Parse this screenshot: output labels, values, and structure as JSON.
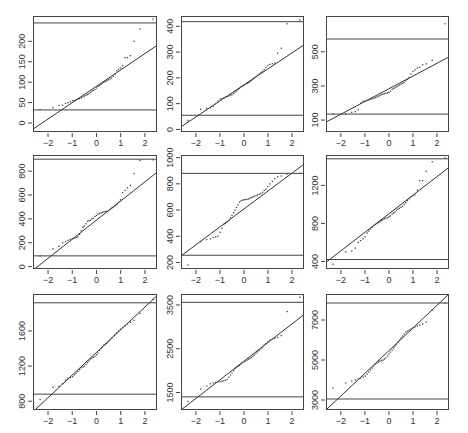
{
  "figure": {
    "title": "",
    "width": 468,
    "height": 433,
    "colors": {
      "frame": "#444444",
      "line": "#333333",
      "points": "#444444",
      "text": "#333333",
      "background": "#ffffff"
    }
  },
  "chart_data": [
    {
      "type": "scatter",
      "panel": "row1-col1",
      "xlabel": "",
      "ylabel": "",
      "xlim": [
        -2.62,
        2.5
      ],
      "ylim": [
        -22,
        262
      ],
      "xticks": [
        -2,
        -1,
        0,
        1,
        2
      ],
      "yticks": [
        0,
        50,
        100,
        150,
        200
      ],
      "hlines": [
        32,
        245
      ],
      "refline": {
        "x": [
          -2.62,
          2.5
        ],
        "y": [
          -15,
          190
        ]
      },
      "points": {
        "x": [
          -2.33,
          -1.8,
          -1.55,
          -1.4,
          -1.28,
          -1.18,
          -1.08,
          -0.99,
          -0.91,
          -0.84,
          -0.77,
          -0.7,
          -0.63,
          -0.56,
          -0.5,
          -0.43,
          -0.37,
          -0.31,
          -0.25,
          -0.19,
          -0.13,
          -0.06,
          0.0,
          0.06,
          0.13,
          0.19,
          0.25,
          0.31,
          0.37,
          0.43,
          0.5,
          0.56,
          0.63,
          0.7,
          0.77,
          0.84,
          0.91,
          0.99,
          1.08,
          1.18,
          1.28,
          1.4,
          1.55,
          1.8,
          2.33
        ],
        "y": [
          33,
          38,
          43,
          44,
          48,
          50,
          52,
          55,
          55,
          57,
          58,
          60,
          62,
          64,
          66,
          68,
          70,
          72,
          75,
          78,
          80,
          82,
          86,
          90,
          92,
          95,
          98,
          100,
          102,
          104,
          106,
          108,
          110,
          115,
          120,
          128,
          132,
          135,
          140,
          160,
          160,
          165,
          200,
          230,
          255
        ]
      }
    },
    {
      "type": "scatter",
      "panel": "row1-col2",
      "xlabel": "",
      "ylabel": "",
      "xlim": [
        -2.62,
        2.5
      ],
      "ylim": [
        -10,
        440
      ],
      "xticks": [
        -2,
        -1,
        0,
        1,
        2
      ],
      "yticks": [
        0,
        100,
        200,
        300,
        400
      ],
      "hlines": [
        55,
        418
      ],
      "refline": {
        "x": [
          -2.62,
          2.5
        ],
        "y": [
          10,
          328
        ]
      },
      "points": {
        "x": [
          -2.33,
          -1.8,
          -1.55,
          -1.4,
          -1.28,
          -1.18,
          -1.08,
          -0.99,
          -0.91,
          -0.84,
          -0.77,
          -0.7,
          -0.63,
          -0.56,
          -0.5,
          -0.43,
          -0.37,
          -0.31,
          -0.25,
          -0.19,
          -0.13,
          -0.06,
          0.0,
          0.06,
          0.13,
          0.19,
          0.25,
          0.31,
          0.37,
          0.43,
          0.5,
          0.56,
          0.63,
          0.7,
          0.77,
          0.84,
          0.91,
          0.99,
          1.08,
          1.18,
          1.28,
          1.4,
          1.55,
          1.8,
          2.33
        ],
        "y": [
          35,
          78,
          82,
          84,
          90,
          100,
          110,
          118,
          120,
          122,
          125,
          128,
          130,
          133,
          135,
          140,
          145,
          150,
          155,
          160,
          165,
          168,
          172,
          175,
          178,
          182,
          185,
          190,
          195,
          200,
          205,
          210,
          215,
          220,
          225,
          232,
          240,
          248,
          252,
          255,
          258,
          296,
          315,
          410,
          425
        ]
      }
    },
    {
      "type": "scatter",
      "panel": "row1-col3",
      "xlabel": "",
      "ylabel": "",
      "xlim": [
        -2.62,
        2.5
      ],
      "ylim": [
        30,
        710
      ],
      "xticks": [
        -2,
        -1,
        0,
        1,
        2
      ],
      "yticks": [
        100,
        300,
        500
      ],
      "hlines": [
        135,
        575
      ],
      "refline": {
        "x": [
          -2.62,
          2.5
        ],
        "y": [
          88,
          470
        ]
      },
      "points": {
        "x": [
          -2.33,
          -1.8,
          -1.55,
          -1.4,
          -1.28,
          -1.18,
          -1.08,
          -0.99,
          -0.91,
          -0.84,
          -0.77,
          -0.7,
          -0.63,
          -0.56,
          -0.5,
          -0.43,
          -0.37,
          -0.31,
          -0.25,
          -0.19,
          -0.13,
          -0.06,
          0.0,
          0.06,
          0.13,
          0.19,
          0.25,
          0.31,
          0.37,
          0.43,
          0.5,
          0.56,
          0.63,
          0.7,
          0.77,
          0.84,
          0.91,
          0.99,
          1.08,
          1.18,
          1.28,
          1.4,
          1.55,
          1.8,
          2.33
        ],
        "y": [
          135,
          138,
          145,
          150,
          160,
          200,
          210,
          212,
          215,
          218,
          222,
          225,
          228,
          232,
          236,
          240,
          245,
          250,
          252,
          255,
          258,
          260,
          262,
          270,
          280,
          285,
          290,
          295,
          300,
          305,
          310,
          315,
          320,
          330,
          340,
          350,
          370,
          385,
          395,
          405,
          410,
          425,
          430,
          450,
          665
        ]
      }
    },
    {
      "type": "scatter",
      "panel": "row2-col1",
      "xlabel": "",
      "ylabel": "",
      "xlim": [
        -2.62,
        2.5
      ],
      "ylim": [
        -20,
        935
      ],
      "xticks": [
        -2,
        -1,
        0,
        1,
        2
      ],
      "yticks": [
        0,
        200,
        400,
        600,
        800
      ],
      "hlines": [
        90,
        900
      ],
      "refline": {
        "x": [
          -2.62,
          2.5
        ],
        "y": [
          -30,
          790
        ]
      },
      "points": {
        "x": [
          -2.33,
          -1.8,
          -1.55,
          -1.4,
          -1.28,
          -1.18,
          -1.08,
          -0.99,
          -0.91,
          -0.84,
          -0.77,
          -0.7,
          -0.63,
          -0.56,
          -0.5,
          -0.43,
          -0.37,
          -0.31,
          -0.25,
          -0.19,
          -0.13,
          -0.06,
          0.0,
          0.06,
          0.13,
          0.19,
          0.25,
          0.31,
          0.37,
          0.43,
          0.5,
          0.56,
          0.63,
          0.7,
          0.77,
          0.84,
          0.91,
          0.99,
          1.08,
          1.18,
          1.28,
          1.4,
          1.55,
          1.8,
          2.33
        ],
        "y": [
          90,
          150,
          170,
          200,
          210,
          220,
          230,
          235,
          240,
          245,
          250,
          270,
          300,
          330,
          340,
          360,
          380,
          385,
          390,
          400,
          405,
          420,
          430,
          440,
          445,
          450,
          455,
          460,
          462,
          465,
          470,
          480,
          490,
          500,
          510,
          520,
          540,
          560,
          620,
          640,
          660,
          680,
          780,
          890,
          895
        ]
      }
    },
    {
      "type": "scatter",
      "panel": "row2-col2",
      "xlabel": "",
      "ylabel": "",
      "xlim": [
        -2.62,
        2.5
      ],
      "ylim": [
        150,
        1020
      ],
      "xticks": [
        -2,
        -1,
        0,
        1,
        2
      ],
      "yticks": [
        200,
        400,
        600,
        800,
        1000
      ],
      "hlines": [
        255,
        880
      ],
      "refline": {
        "x": [
          -2.62,
          2.5
        ],
        "y": [
          250,
          950
        ]
      },
      "points": {
        "x": [
          -2.33,
          -1.8,
          -1.55,
          -1.4,
          -1.28,
          -1.18,
          -1.08,
          -0.99,
          -0.91,
          -0.84,
          -0.77,
          -0.7,
          -0.63,
          -0.56,
          -0.5,
          -0.43,
          -0.37,
          -0.31,
          -0.25,
          -0.19,
          -0.13,
          -0.06,
          0.0,
          0.06,
          0.13,
          0.19,
          0.25,
          0.31,
          0.37,
          0.43,
          0.5,
          0.56,
          0.63,
          0.7,
          0.77,
          0.84,
          0.91,
          0.99,
          1.08,
          1.18,
          1.28,
          1.4,
          1.55,
          1.8,
          2.33
        ],
        "y": [
          180,
          360,
          375,
          380,
          390,
          395,
          400,
          430,
          460,
          490,
          500,
          510,
          520,
          540,
          560,
          580,
          600,
          620,
          640,
          660,
          670,
          675,
          680,
          680,
          682,
          685,
          690,
          695,
          700,
          705,
          710,
          715,
          720,
          725,
          735,
          750,
          760,
          780,
          800,
          820,
          840,
          855,
          860,
          875,
          880
        ]
      }
    },
    {
      "type": "scatter",
      "panel": "row2-col3",
      "xlabel": "",
      "ylabel": "",
      "xlim": [
        -2.62,
        2.5
      ],
      "ylim": [
        320,
        1520
      ],
      "xticks": [
        -2,
        -1,
        0,
        1,
        2
      ],
      "yticks": [
        400,
        800,
        1200
      ],
      "hlines": [
        420,
        1480
      ],
      "refline": {
        "x": [
          -2.62,
          2.5
        ],
        "y": [
          390,
          1390
        ]
      },
      "points": {
        "x": [
          -2.33,
          -1.8,
          -1.55,
          -1.4,
          -1.28,
          -1.18,
          -1.08,
          -0.99,
          -0.91,
          -0.84,
          -0.77,
          -0.7,
          -0.63,
          -0.56,
          -0.5,
          -0.43,
          -0.37,
          -0.31,
          -0.25,
          -0.19,
          -0.13,
          -0.06,
          0.0,
          0.06,
          0.13,
          0.19,
          0.25,
          0.31,
          0.37,
          0.43,
          0.5,
          0.56,
          0.63,
          0.7,
          0.77,
          0.84,
          0.91,
          0.99,
          1.08,
          1.18,
          1.28,
          1.4,
          1.55,
          1.8,
          2.33
        ],
        "y": [
          370,
          500,
          510,
          540,
          600,
          620,
          640,
          660,
          700,
          720,
          740,
          760,
          780,
          790,
          800,
          810,
          820,
          830,
          840,
          850,
          855,
          860,
          870,
          880,
          900,
          910,
          920,
          940,
          950,
          960,
          970,
          980,
          1000,
          1020,
          1040,
          1060,
          1080,
          1090,
          1100,
          1150,
          1250,
          1250,
          1350,
          1450,
          1490
        ]
      }
    },
    {
      "type": "scatter",
      "panel": "row3-col1",
      "xlabel": "",
      "ylabel": "",
      "xlim": [
        -2.62,
        2.5
      ],
      "ylim": [
        700,
        2020
      ],
      "xticks": [
        -2,
        -1,
        0,
        1,
        2
      ],
      "yticks": [
        800,
        1200,
        1600
      ],
      "hlines": [
        880,
        1920
      ],
      "refline": {
        "x": [
          -2.62,
          2.5
        ],
        "y": [
          680,
          2000
        ]
      },
      "points": {
        "x": [
          -2.33,
          -1.8,
          -1.55,
          -1.4,
          -1.28,
          -1.18,
          -1.08,
          -0.99,
          -0.91,
          -0.84,
          -0.77,
          -0.7,
          -0.63,
          -0.56,
          -0.5,
          -0.43,
          -0.37,
          -0.31,
          -0.25,
          -0.19,
          -0.13,
          -0.06,
          0.0,
          0.06,
          0.13,
          0.19,
          0.25,
          0.31,
          0.37,
          0.43,
          0.5,
          0.56,
          0.63,
          0.7,
          0.77,
          0.84,
          0.91,
          0.99,
          1.08,
          1.18,
          1.28,
          1.4,
          1.55,
          1.8,
          2.33
        ],
        "y": [
          820,
          960,
          970,
          1000,
          1040,
          1060,
          1070,
          1080,
          1100,
          1120,
          1140,
          1160,
          1180,
          1190,
          1200,
          1220,
          1240,
          1260,
          1280,
          1290,
          1300,
          1310,
          1330,
          1350,
          1380,
          1400,
          1420,
          1440,
          1450,
          1460,
          1480,
          1500,
          1520,
          1540,
          1560,
          1580,
          1600,
          1620,
          1640,
          1660,
          1680,
          1700,
          1720,
          1800,
          1960
        ]
      }
    },
    {
      "type": "scatter",
      "panel": "row3-col2",
      "xlabel": "",
      "ylabel": "",
      "xlim": [
        -2.62,
        2.5
      ],
      "ylim": [
        1100,
        3750
      ],
      "xticks": [
        -2,
        -1,
        0,
        1,
        2
      ],
      "yticks": [
        1500,
        2500,
        3500
      ],
      "hlines": [
        1400,
        3560
      ],
      "refline": {
        "x": [
          -2.62,
          2.5
        ],
        "y": [
          1100,
          3280
        ]
      },
      "points": {
        "x": [
          -2.33,
          -1.8,
          -1.55,
          -1.4,
          -1.28,
          -1.18,
          -1.08,
          -0.99,
          -0.91,
          -0.84,
          -0.77,
          -0.7,
          -0.63,
          -0.56,
          -0.5,
          -0.43,
          -0.37,
          -0.31,
          -0.25,
          -0.19,
          -0.13,
          -0.06,
          0.0,
          0.06,
          0.13,
          0.19,
          0.25,
          0.31,
          0.37,
          0.43,
          0.5,
          0.56,
          0.63,
          0.7,
          0.77,
          0.84,
          0.91,
          0.99,
          1.08,
          1.18,
          1.28,
          1.4,
          1.55,
          1.8,
          2.33
        ],
        "y": [
          1300,
          1580,
          1650,
          1700,
          1720,
          1730,
          1740,
          1750,
          1760,
          1770,
          1780,
          1800,
          1850,
          1900,
          1950,
          2000,
          2050,
          2080,
          2100,
          2120,
          2150,
          2180,
          2200,
          2220,
          2240,
          2260,
          2280,
          2300,
          2330,
          2360,
          2400,
          2430,
          2460,
          2500,
          2540,
          2580,
          2620,
          2660,
          2700,
          2720,
          2740,
          2760,
          2800,
          3350,
          3680
        ]
      }
    },
    {
      "type": "scatter",
      "panel": "row3-col3",
      "xlabel": "",
      "ylabel": "",
      "xlim": [
        -2.62,
        2.5
      ],
      "ylim": [
        2500,
        8300
      ],
      "xticks": [
        -2,
        -1,
        0,
        1,
        2
      ],
      "yticks": [
        3000,
        5000,
        7000
      ],
      "hlines": [
        3050,
        7850
      ],
      "refline": {
        "x": [
          -2.62,
          2.5
        ],
        "y": [
          2500,
          8300
        ]
      },
      "points": {
        "x": [
          -2.33,
          -1.8,
          -1.55,
          -1.4,
          -1.28,
          -1.18,
          -1.08,
          -0.99,
          -0.91,
          -0.84,
          -0.77,
          -0.7,
          -0.63,
          -0.56,
          -0.5,
          -0.43,
          -0.37,
          -0.31,
          -0.25,
          -0.19,
          -0.13,
          -0.06,
          0.0,
          0.06,
          0.13,
          0.19,
          0.25,
          0.31,
          0.37,
          0.43,
          0.5,
          0.56,
          0.63,
          0.7,
          0.77,
          0.84,
          0.91,
          0.99,
          1.08,
          1.18,
          1.28,
          1.4,
          1.55,
          1.8,
          2.33
        ],
        "y": [
          3600,
          3850,
          3950,
          4000,
          4050,
          4100,
          4150,
          4200,
          4300,
          4400,
          4500,
          4600,
          4700,
          4800,
          4850,
          4900,
          4950,
          4980,
          5000,
          5050,
          5100,
          5200,
          5300,
          5400,
          5500,
          5600,
          5700,
          5800,
          5900,
          6000,
          6100,
          6200,
          6300,
          6400,
          6450,
          6500,
          6550,
          6600,
          6650,
          6700,
          6750,
          6800,
          6900,
          7500,
          7850
        ]
      }
    }
  ],
  "layout": {
    "panels": [
      {
        "x0": 33,
        "x1": 157,
        "y0": 16,
        "y1": 132
      },
      {
        "x0": 181,
        "x1": 304,
        "y0": 16,
        "y1": 132
      },
      {
        "x0": 326,
        "x1": 449,
        "y0": 16,
        "y1": 132
      },
      {
        "x0": 33,
        "x1": 157,
        "y0": 155,
        "y1": 269
      },
      {
        "x0": 181,
        "x1": 304,
        "y0": 155,
        "y1": 269
      },
      {
        "x0": 326,
        "x1": 449,
        "y0": 155,
        "y1": 269
      },
      {
        "x0": 33,
        "x1": 157,
        "y0": 294,
        "y1": 410
      },
      {
        "x0": 181,
        "x1": 304,
        "y0": 294,
        "y1": 410
      },
      {
        "x0": 326,
        "x1": 449,
        "y0": 294,
        "y1": 410
      }
    ]
  }
}
